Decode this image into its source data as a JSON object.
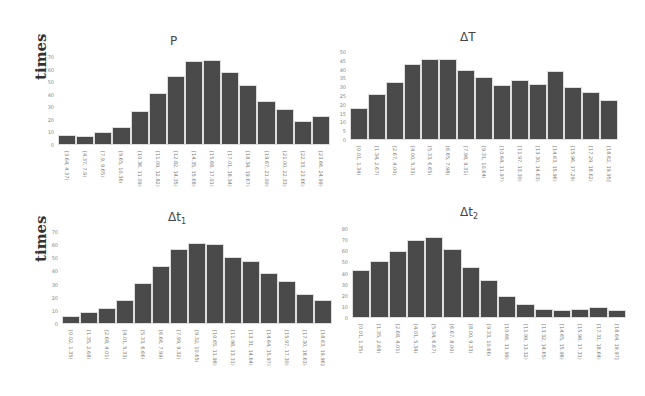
{
  "chart_data": [
    {
      "type": "bar",
      "title": "P",
      "ylabel": "times",
      "xlabel": "",
      "ylim": [
        0,
        70
      ],
      "yticks": [
        0,
        10,
        20,
        30,
        40,
        50,
        60,
        70
      ],
      "categories": [
        "[3.64, 4.37)",
        "[4.37, 7.9)",
        "[7.9, 9.65)",
        "[9.65, 10.36)",
        "[10.36, 11.09)",
        "[11.09, 12.82)",
        "[12.82, 14.35)",
        "[14.35, 15.68)",
        "[15.68, 17.01)",
        "[17.01, 18.34)",
        "[18.34, 19.67)",
        "[19.67, 21.00)",
        "[21.00, 22.33)",
        "[22.33, 23.66)",
        "[23.66, 24.99)"
      ],
      "values": [
        8,
        7,
        10,
        14,
        27,
        41,
        55,
        67,
        68,
        58,
        48,
        35,
        29,
        19,
        23
      ],
      "grid": false,
      "legend": "none"
    },
    {
      "type": "bar",
      "title": "ΔT",
      "ylabel": "",
      "xlabel": "",
      "ylim": [
        0,
        50
      ],
      "yticks": [
        0,
        5,
        10,
        15,
        20,
        25,
        30,
        35,
        40,
        45,
        50
      ],
      "categories": [
        "[0.01, 1.34)",
        "[1.34, 2.67)",
        "[2.67, 4.00)",
        "[4.00, 5.33)",
        "[5.33, 6.65)",
        "[6.65, 7.98)",
        "[7.98, 9.31)",
        "[9.31, 10.64)",
        "[10.64, 11.97)",
        "[11.97, 13.30)",
        "[13.30, 14.63)",
        "[14.63, 15.96)",
        "[15.96, 17.29)",
        "[17.29, 18.62)",
        "[18.62, 19.95]"
      ],
      "values": [
        18,
        26,
        33,
        43,
        46,
        46,
        40,
        36,
        31,
        34,
        32,
        39,
        30,
        27,
        23
      ],
      "grid": false,
      "legend": "none"
    },
    {
      "type": "bar",
      "title": "Δt1",
      "ylabel": "times",
      "xlabel": "",
      "ylim": [
        0,
        70
      ],
      "yticks": [
        0,
        10,
        20,
        30,
        40,
        50,
        60,
        70
      ],
      "categories": [
        "[0.02, 1.35)",
        "[1.35, 2.68)",
        "[2.68, 4.01)",
        "[4.01, 5.33)",
        "[5.33, 6.66)",
        "[6.66, 7.99)",
        "[7.99, 9.32)",
        "[9.32, 10.65)",
        "[10.65, 11.98)",
        "[11.98, 13.31)",
        "[13.31, 14.64)",
        "[14.64, 15.97)",
        "[15.97, 17.30)",
        "[17.30, 18.63)",
        "[18.63, 19.96]"
      ],
      "values": [
        6,
        9,
        12,
        18,
        31,
        44,
        57,
        62,
        61,
        51,
        48,
        39,
        33,
        23,
        18
      ],
      "grid": false,
      "legend": "none"
    },
    {
      "type": "bar",
      "title": "Δt2",
      "ylabel": "",
      "xlabel": "",
      "ylim": [
        0,
        80
      ],
      "yticks": [
        0,
        10,
        20,
        30,
        40,
        50,
        60,
        70,
        80
      ],
      "categories": [
        "[0.01, 1.35)",
        "[1.35, 2.68)",
        "[2.68, 4.01)",
        "[4.01, 5.34)",
        "[5.34, 6.67)",
        "[6.67, 8.00)",
        "[8.00, 9.33)",
        "[9.33, 10.66)",
        "[10.66, 11.99)",
        "[11.99, 13.32)",
        "[13.32, 14.65)",
        "[14.65, 15.98)",
        "[15.98, 17.31)",
        "[17.31, 18.64)",
        "[18.64, 19.97]"
      ],
      "values": [
        43,
        51,
        60,
        70,
        73,
        62,
        46,
        34,
        20,
        13,
        8,
        7,
        8,
        10,
        7
      ],
      "grid": false,
      "legend": "none"
    }
  ],
  "layout": {
    "bar_color": "#4a4a4a",
    "bar_edge_color": "#dddddd",
    "background": "#ffffff"
  },
  "panels": [
    {
      "key": "p",
      "title": "P",
      "sub": "",
      "ylabel": "times",
      "x": 58,
      "y": 57,
      "w": 272,
      "h": 88,
      "title_x": 180,
      "title_y": 34,
      "ylabel_x": 32,
      "ylabel_y": 80
    },
    {
      "key": "dT",
      "title": "ΔT",
      "sub": "",
      "ylabel": "",
      "x": 350,
      "y": 52,
      "w": 268,
      "h": 88,
      "title_x": 470,
      "title_y": 30,
      "ylabel_x": 0,
      "ylabel_y": 0
    },
    {
      "key": "dt1",
      "title": "Δt",
      "sub": "1",
      "ylabel": "times",
      "x": 62,
      "y": 232,
      "w": 270,
      "h": 92,
      "title_x": 178,
      "title_y": 210,
      "ylabel_x": 32,
      "ylabel_y": 262
    },
    {
      "key": "dt2",
      "title": "Δt",
      "sub": "2",
      "ylabel": "",
      "x": 352,
      "y": 229,
      "w": 274,
      "h": 89,
      "title_x": 470,
      "title_y": 205,
      "ylabel_x": 0,
      "ylabel_y": 0
    }
  ]
}
